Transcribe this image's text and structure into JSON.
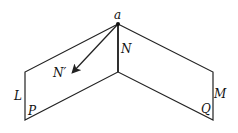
{
  "diagram": {
    "labels": {
      "apex": "a",
      "normal": "N",
      "normal_prime": "N′",
      "left_edge": "L",
      "left_corner": "P",
      "right_edge": "M",
      "right_corner": "Q"
    },
    "colors": {
      "line": "#222222",
      "background": "#ffffff"
    }
  }
}
